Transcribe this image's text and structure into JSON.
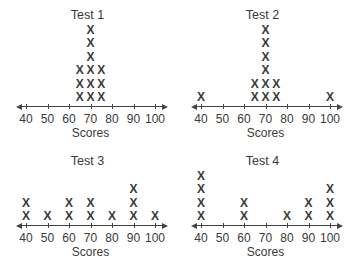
{
  "chart_data": [
    {
      "type": "dot_plot",
      "title": "Test 1",
      "xlabel": "Scores",
      "ticks": [
        40,
        50,
        60,
        70,
        80,
        90,
        100
      ],
      "xlim": [
        35,
        105
      ],
      "marker": "X",
      "points": [
        {
          "x": 65,
          "count": 3
        },
        {
          "x": 70,
          "count": 6
        },
        {
          "x": 75,
          "count": 3
        }
      ]
    },
    {
      "type": "dot_plot",
      "title": "Test 2",
      "xlabel": "Scores",
      "ticks": [
        40,
        50,
        60,
        70,
        80,
        90,
        100
      ],
      "xlim": [
        35,
        105
      ],
      "marker": "X",
      "points": [
        {
          "x": 40,
          "count": 1
        },
        {
          "x": 65,
          "count": 2
        },
        {
          "x": 70,
          "count": 6
        },
        {
          "x": 75,
          "count": 2
        },
        {
          "x": 100,
          "count": 1
        }
      ]
    },
    {
      "type": "dot_plot",
      "title": "Test 3",
      "xlabel": "Scores",
      "ticks": [
        40,
        50,
        60,
        70,
        80,
        90,
        100
      ],
      "xlim": [
        35,
        105
      ],
      "marker": "X",
      "points": [
        {
          "x": 40,
          "count": 2
        },
        {
          "x": 50,
          "count": 1
        },
        {
          "x": 60,
          "count": 2
        },
        {
          "x": 70,
          "count": 2
        },
        {
          "x": 80,
          "count": 1
        },
        {
          "x": 90,
          "count": 3
        },
        {
          "x": 100,
          "count": 1
        }
      ]
    },
    {
      "type": "dot_plot",
      "title": "Test 4",
      "xlabel": "Scores",
      "ticks": [
        40,
        50,
        60,
        70,
        80,
        90,
        100
      ],
      "xlim": [
        35,
        105
      ],
      "marker": "X",
      "points": [
        {
          "x": 40,
          "count": 4
        },
        {
          "x": 60,
          "count": 2
        },
        {
          "x": 80,
          "count": 1
        },
        {
          "x": 90,
          "count": 2
        },
        {
          "x": 100,
          "count": 3
        }
      ]
    }
  ],
  "layout": {
    "panels": [
      {
        "left": 0,
        "top": 0,
        "axis_y": 106
      },
      {
        "left": 175,
        "top": 0,
        "axis_y": 106
      },
      {
        "left": 0,
        "top": 136,
        "axis_y": 89
      },
      {
        "left": 175,
        "top": 136,
        "axis_y": 89
      }
    ],
    "x_start": 16,
    "x_end": 168,
    "tick_first_px": 26,
    "tick_spacing_px": 21.5,
    "mark_step_px": 13.5
  }
}
